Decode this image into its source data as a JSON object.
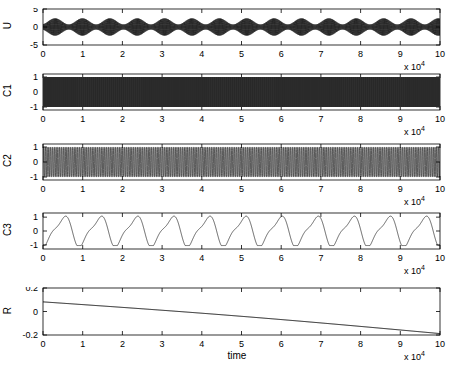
{
  "figure": {
    "width": 462,
    "height": 370,
    "background": "#ffffff",
    "axis_color": "#000000",
    "line_color": "#000000",
    "xlabel": "time",
    "exponent_label": "x 10",
    "exponent_power": "4"
  },
  "chart_data": [
    {
      "type": "line",
      "name": "U",
      "title": "",
      "xlabel": "time",
      "ylabel": "U",
      "xlim": [
        0,
        100000
      ],
      "ylim": [
        -5,
        5
      ],
      "xticks": [
        0,
        10000,
        20000,
        30000,
        40000,
        50000,
        60000,
        70000,
        80000,
        90000,
        100000
      ],
      "xticklabels": [
        "0",
        "1",
        "2",
        "3",
        "4",
        "5",
        "6",
        "7",
        "8",
        "9",
        "10"
      ],
      "yticks": [
        -5,
        0,
        5
      ],
      "yticklabels": [
        "-5",
        "0",
        "5"
      ],
      "x_scale_exponent": 4,
      "grid": false,
      "legend": "none",
      "description": "fast carrier oscillation with slow amplitude envelope modulation",
      "model": {
        "kind": "modulated_carrier",
        "carrier_cycles_per_unit": 45,
        "envelope_cycles_per_unit": 1.45,
        "amplitude_mean": 1.55,
        "amplitude_swing": 0.85,
        "offset": 0.0
      }
    },
    {
      "type": "line",
      "name": "C1",
      "title": "",
      "xlabel": "",
      "ylabel": "C1",
      "xlim": [
        0,
        100000
      ],
      "ylim": [
        -1.2,
        1.2
      ],
      "xticks": [
        0,
        10000,
        20000,
        30000,
        40000,
        50000,
        60000,
        70000,
        80000,
        90000,
        100000
      ],
      "xticklabels": [
        "0",
        "1",
        "2",
        "3",
        "4",
        "5",
        "6",
        "7",
        "8",
        "9",
        "10"
      ],
      "yticks": [
        -1,
        0,
        1
      ],
      "yticklabels": [
        "-1",
        "0",
        "1"
      ],
      "x_scale_exponent": 4,
      "grid": false,
      "legend": "none",
      "description": "very high frequency oscillation rendered as solid filled band between -1 and 1",
      "model": {
        "kind": "dense_fill",
        "fill_color": "#2e2e2e",
        "fill_top": 1.0,
        "fill_bottom": -1.0
      }
    },
    {
      "type": "line",
      "name": "C2",
      "title": "",
      "xlabel": "",
      "ylabel": "C2",
      "xlim": [
        0,
        100000
      ],
      "ylim": [
        -1.2,
        1.2
      ],
      "xticks": [
        0,
        10000,
        20000,
        30000,
        40000,
        50000,
        60000,
        70000,
        80000,
        90000,
        100000
      ],
      "xticklabels": [
        "0",
        "1",
        "2",
        "3",
        "4",
        "5",
        "6",
        "7",
        "8",
        "9",
        "10"
      ],
      "yticks": [
        -1,
        0,
        1
      ],
      "yticklabels": [
        "-1",
        "0",
        "1"
      ],
      "x_scale_exponent": 4,
      "grid": false,
      "legend": "none",
      "description": "medium frequency oscillation with visible individual cycles, near saturation at +/-1",
      "model": {
        "kind": "saturated_oscillation",
        "cycles_per_unit": 22,
        "amplitude": 1.0,
        "sharpness": 2.6
      }
    },
    {
      "type": "line",
      "name": "C3",
      "title": "",
      "xlabel": "",
      "ylabel": "C3",
      "xlim": [
        0,
        100000
      ],
      "ylim": [
        -1.3,
        1.3
      ],
      "xticks": [
        0,
        10000,
        20000,
        30000,
        40000,
        50000,
        60000,
        70000,
        80000,
        90000,
        100000
      ],
      "xticklabels": [
        "0",
        "1",
        "2",
        "3",
        "4",
        "5",
        "6",
        "7",
        "8",
        "9",
        "10"
      ],
      "yticks": [
        -1,
        0,
        1
      ],
      "yticklabels": [
        "-1",
        "0",
        "1"
      ],
      "x_scale_exponent": 4,
      "grid": false,
      "legend": "none",
      "description": "slow smooth oscillation, roughly one cycle per 1e4 with secondary harmonic bump",
      "model": {
        "kind": "two_harmonic",
        "fundamental_cycles_per_unit": 1.1,
        "fundamental_amplitude": 1.0,
        "harmonic_cycles_per_unit": 2.2,
        "harmonic_amplitude": 0.3,
        "phase": -1.9
      }
    },
    {
      "type": "line",
      "name": "R",
      "title": "",
      "xlabel": "time",
      "ylabel": "R",
      "xlim": [
        0,
        100000
      ],
      "ylim": [
        -0.2,
        0.2
      ],
      "xticks": [
        0,
        10000,
        20000,
        30000,
        40000,
        50000,
        60000,
        70000,
        80000,
        90000,
        100000
      ],
      "xticklabels": [
        "0",
        "1",
        "2",
        "3",
        "4",
        "5",
        "6",
        "7",
        "8",
        "9",
        "10"
      ],
      "yticks": [
        -0.2,
        0,
        0.2
      ],
      "yticklabels": [
        "-0.2",
        "0",
        "0.2"
      ],
      "x_scale_exponent": 4,
      "grid": false,
      "legend": "none",
      "description": "slow monotonic near-linear decay from about 0.08 to about -0.19",
      "model": {
        "kind": "linear_decay",
        "y_start": 0.082,
        "y_end": -0.188,
        "curvature": 0.012
      }
    }
  ],
  "panels": [
    {
      "key": "U",
      "ylabel": "U",
      "plot": {
        "left": 43,
        "top": 9,
        "width": 397,
        "height": 36
      }
    },
    {
      "key": "C1",
      "ylabel": "C1",
      "plot": {
        "left": 43,
        "top": 74,
        "width": 397,
        "height": 36
      }
    },
    {
      "key": "C2",
      "ylabel": "C2",
      "plot": {
        "left": 43,
        "top": 144,
        "width": 397,
        "height": 36
      }
    },
    {
      "key": "C3",
      "ylabel": "C3",
      "plot": {
        "left": 43,
        "top": 213,
        "width": 397,
        "height": 36
      }
    },
    {
      "key": "R",
      "ylabel": "R",
      "plot": {
        "left": 43,
        "top": 288,
        "width": 397,
        "height": 47
      }
    }
  ]
}
